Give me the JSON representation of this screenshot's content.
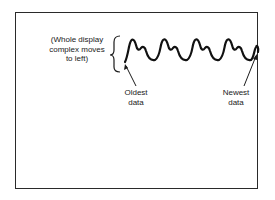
{
  "diagram": {
    "brace_label": "(Whole display complex moves to left)",
    "brace_label_lines": [
      "(Whole display",
      "complex moves",
      "to left)"
    ],
    "oldest_label_lines": [
      "Oldest",
      "data"
    ],
    "newest_label_lines": [
      "Newest",
      "data"
    ],
    "waveform": {
      "cycles": 5,
      "direction": "moves left",
      "start": "Oldest data",
      "end": "Newest data"
    },
    "colors": {
      "ink": "#1a1a1a",
      "background": "#ffffff"
    }
  }
}
